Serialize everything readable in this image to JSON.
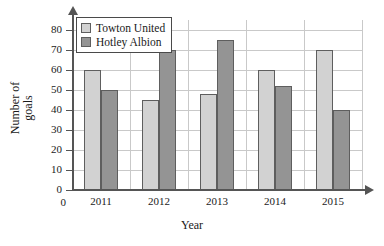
{
  "chart_data": {
    "type": "bar",
    "title": "",
    "xlabel": "Year",
    "ylabel": "Number of goals",
    "categories": [
      "2011",
      "2012",
      "2013",
      "2014",
      "2015"
    ],
    "series": [
      {
        "name": "Towton United",
        "values": [
          60,
          45,
          48,
          60,
          70
        ],
        "color": "#d2d2d2"
      },
      {
        "name": "Hotley Albion",
        "values": [
          50,
          70,
          75,
          52,
          40
        ],
        "color": "#949494"
      }
    ],
    "ylim": [
      0,
      85
    ],
    "y_ticks": [
      0,
      10,
      20,
      30,
      40,
      50,
      60,
      70,
      80
    ],
    "grid": true,
    "legend_position": "top-left",
    "origin_label": "0"
  },
  "axis": {
    "y_title_line1": "Number of",
    "y_title_line2": "goals",
    "x_title": "Year"
  }
}
